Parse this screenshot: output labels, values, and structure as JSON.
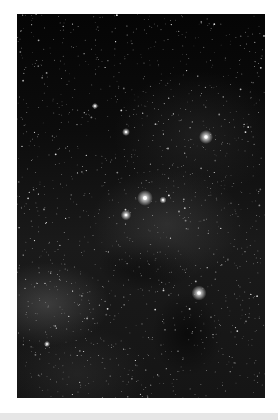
{
  "image": {
    "subject": "Milky Way star field with dark nebulae",
    "alt": "Dense star field photograph with several bright stars and dark dust lanes"
  },
  "bright_stars": [
    {
      "x": 189,
      "y": 123,
      "r": 3.2
    },
    {
      "x": 128,
      "y": 184,
      "r": 3.6
    },
    {
      "x": 182,
      "y": 279,
      "r": 3.4
    },
    {
      "x": 109,
      "y": 201,
      "r": 2.4
    },
    {
      "x": 109,
      "y": 118,
      "r": 1.8
    },
    {
      "x": 146,
      "y": 186,
      "r": 1.6
    },
    {
      "x": 78,
      "y": 92,
      "r": 1.4
    },
    {
      "x": 30,
      "y": 330,
      "r": 1.4
    }
  ],
  "colors": {
    "page_background": "#ffffff",
    "footer_bar": "#e6e6e6"
  }
}
